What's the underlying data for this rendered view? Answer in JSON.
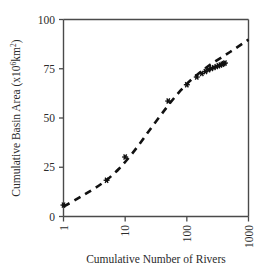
{
  "chart_data": {
    "type": "scatter",
    "title": "",
    "xlabel": "Cumulative Number of Rivers",
    "ylabel": "Cumulative Basin Area (x10",
    "ylabel_sup": "6",
    "ylabel_tail": "km",
    "ylabel_sup2": "2",
    "ylabel_close": ")",
    "ylabel_full": "Cumulative Basin Area (x10^6 km^2)",
    "xscale": "log",
    "yscale": "linear",
    "xlim": [
      1,
      1000
    ],
    "ylim": [
      0,
      100
    ],
    "grid": false,
    "legend": "none",
    "xticks": [
      1,
      10,
      100,
      1000
    ],
    "xticklabels": [
      "1",
      "10",
      "100",
      "1000"
    ],
    "xticklabel_rotation": -90,
    "yticks": [
      0,
      25,
      50,
      75,
      100
    ],
    "yticklabels": [
      "0",
      "25",
      "50",
      "75",
      "100"
    ],
    "marker_style": "star-asterisk",
    "marker_color": "#101010",
    "curve_style": "dashed",
    "curve_color": "#111111",
    "points": [
      {
        "x": 1,
        "y": 5.8
      },
      {
        "x": 5,
        "y": 18.4
      },
      {
        "x": 10,
        "y": 30.2
      },
      {
        "x": 50,
        "y": 58.6
      },
      {
        "x": 100,
        "y": 66.9
      },
      {
        "x": 145,
        "y": 70.8
      },
      {
        "x": 175,
        "y": 72.6
      },
      {
        "x": 200,
        "y": 73.6
      },
      {
        "x": 225,
        "y": 74.5
      },
      {
        "x": 250,
        "y": 75.1
      },
      {
        "x": 275,
        "y": 75.6
      },
      {
        "x": 300,
        "y": 76.1
      },
      {
        "x": 325,
        "y": 76.5
      },
      {
        "x": 350,
        "y": 76.9
      },
      {
        "x": 375,
        "y": 77.3
      },
      {
        "x": 395,
        "y": 77.6
      },
      {
        "x": 415,
        "y": 77.9
      }
    ],
    "curve_points": [
      {
        "x": 1,
        "y": 5.0
      },
      {
        "x": 1.6,
        "y": 8.6
      },
      {
        "x": 2.5,
        "y": 12.2
      },
      {
        "x": 4,
        "y": 16.2
      },
      {
        "x": 6.3,
        "y": 21.0
      },
      {
        "x": 10,
        "y": 27.5
      },
      {
        "x": 16,
        "y": 35.5
      },
      {
        "x": 25,
        "y": 44.0
      },
      {
        "x": 40,
        "y": 52.5
      },
      {
        "x": 63,
        "y": 60.5
      },
      {
        "x": 100,
        "y": 67.5
      },
      {
        "x": 160,
        "y": 73.0
      },
      {
        "x": 250,
        "y": 77.5
      },
      {
        "x": 400,
        "y": 81.5
      },
      {
        "x": 630,
        "y": 85.5
      },
      {
        "x": 1000,
        "y": 89.8
      }
    ]
  },
  "figure": {
    "background": "#ffffff",
    "axis_color": "#4a4a4a",
    "text_color": "#2b2b2b"
  }
}
